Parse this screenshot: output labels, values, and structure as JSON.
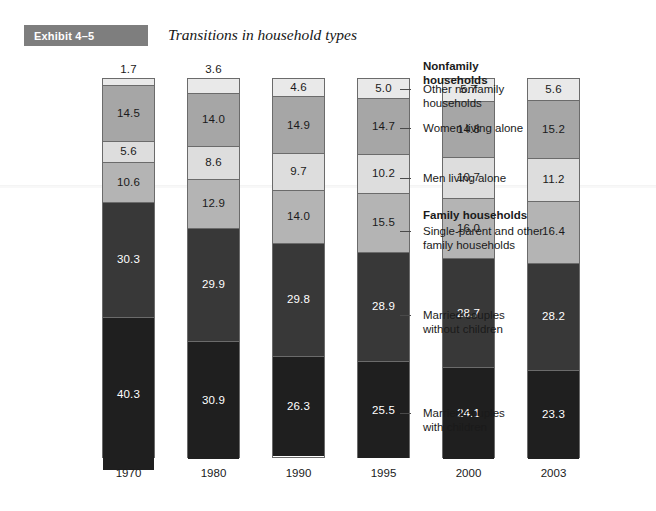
{
  "exhibit": {
    "banner_label": "Exhibit 4–5",
    "title": "Transitions in household types"
  },
  "chart_data": {
    "type": "bar",
    "subtype": "stacked-percentage-bar",
    "title": "Transitions in household types",
    "xlabel": "",
    "ylabel": "",
    "ylim": [
      0,
      100
    ],
    "grid": false,
    "legend_position": "right",
    "categories": [
      "1970",
      "1980",
      "1990",
      "1995",
      "2000",
      "2003"
    ],
    "series": [
      {
        "name": "Other nonfamily households",
        "group": "Nonfamily households",
        "color": "#e9e9e9",
        "text_color": "#1a1a1a",
        "values": [
          1.7,
          3.6,
          4.6,
          5.0,
          5.7,
          5.6
        ]
      },
      {
        "name": "Women living alone",
        "group": "Nonfamily households",
        "color": "#a6a6a6",
        "text_color": "#1a1a1a",
        "values": [
          14.5,
          14.0,
          14.9,
          14.7,
          14.8,
          15.2
        ]
      },
      {
        "name": "Men living alone",
        "group": "Nonfamily households",
        "color": "#dddddd",
        "text_color": "#1a1a1a",
        "values": [
          5.6,
          8.6,
          9.7,
          10.2,
          10.7,
          11.2
        ]
      },
      {
        "name": "Single-parent and other family households",
        "group": "Family households",
        "color": "#b4b4b4",
        "text_color": "#1a1a1a",
        "values": [
          10.6,
          12.9,
          14.0,
          15.5,
          16.0,
          16.4
        ]
      },
      {
        "name": "Married couples without children",
        "group": "Family households",
        "color": "#383838",
        "text_color": "#ffffff",
        "values": [
          30.3,
          29.9,
          29.8,
          28.9,
          28.7,
          28.2
        ]
      },
      {
        "name": "Married couples with children",
        "group": "Family households",
        "color": "#1f1f1f",
        "text_color": "#ffffff",
        "values": [
          40.3,
          30.9,
          26.3,
          25.5,
          24.1,
          23.3
        ]
      }
    ],
    "legend_groups": [
      {
        "heading": "Nonfamily households"
      },
      {
        "heading": "Family households"
      }
    ],
    "annotations": [
      "1.7 value for 1970 is printed above the bar because the segment is too thin"
    ]
  },
  "legend": {
    "nonfamily_heading": "Nonfamily\nhouseholds",
    "other_nonfamily": "Other nonfamily\nhouseholds",
    "women_alone": "Women living alone",
    "men_alone": "Men living alone",
    "family_heading": "Family households",
    "single_parent": "Single-parent and other\nfamily households",
    "married_without": "Married couples\nwithout children",
    "married_with": "Married couples\nwith children"
  }
}
